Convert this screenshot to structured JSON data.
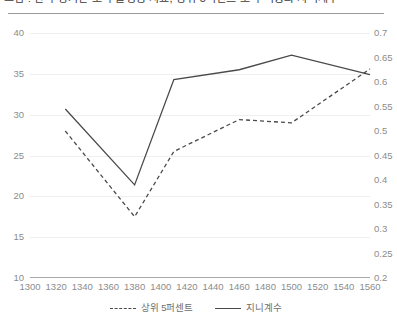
{
  "chart_data": {
    "type": "line",
    "title": "그림 : 한국 장기간 소득 불평등 지표, 상위 5퍼센트 소득 비중과 지니계수",
    "xlabel": "",
    "ylabel": "",
    "ylabel_right": "",
    "grid": true,
    "legend_position": "bottom",
    "xlim": [
      1300,
      1560
    ],
    "xticks": [
      1300,
      1320,
      1340,
      1360,
      1380,
      1400,
      1420,
      1440,
      1460,
      1480,
      1500,
      1520,
      1540,
      1560
    ],
    "left_axis": {
      "lim": [
        10,
        40
      ],
      "ticks": [
        10,
        15,
        20,
        25,
        30,
        35,
        40
      ],
      "tick_labels": [
        "10",
        "15",
        "20",
        "25",
        "30",
        "35",
        "40"
      ]
    },
    "right_axis": {
      "lim": [
        0.2,
        0.7
      ],
      "ticks": [
        0.2,
        0.25,
        0.3,
        0.35,
        0.4,
        0.45,
        0.5,
        0.55,
        0.6,
        0.65,
        0.7
      ],
      "tick_labels": [
        "0.2",
        "0.25",
        "0.3",
        "0.35",
        "0.4",
        "0.45",
        "0.5",
        "0.55",
        "0.6",
        "0.65",
        "0.7"
      ]
    },
    "series": [
      {
        "name": "상위 5퍼센트",
        "style": "dashed",
        "axis": "left",
        "color": "#4a4a4a",
        "x": [
          1327,
          1380,
          1410,
          1460,
          1500,
          1560
        ],
        "values": [
          28.0,
          17.5,
          25.5,
          29.4,
          29.0,
          35.6
        ]
      },
      {
        "name": "지니계수",
        "style": "solid",
        "axis": "right",
        "color": "#4a4a4a",
        "x": [
          1327,
          1380,
          1410,
          1460,
          1500,
          1560
        ],
        "values": [
          0.545,
          0.39,
          0.605,
          0.625,
          0.655,
          0.615
        ]
      }
    ]
  },
  "legend": {
    "items": [
      {
        "label": "상위 5퍼센트",
        "style": "dashed"
      },
      {
        "label": "지니계수",
        "style": "solid"
      }
    ]
  }
}
